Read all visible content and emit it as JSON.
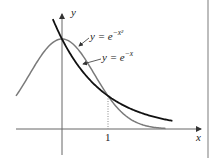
{
  "chart_data": {
    "type": "line",
    "title": "",
    "xlabel": "x",
    "ylabel": "y",
    "x_ticks": [
      "1"
    ],
    "xlim": [
      -1.0,
      2.4
    ],
    "ylim": [
      -0.35,
      1.4
    ],
    "grid": false,
    "annotations": [
      {
        "text": "dotted vertical line at x = 1 from axis to curve intersection",
        "x": 1,
        "y": 0.368
      }
    ],
    "series": [
      {
        "name": "y = e^{-x^2}",
        "label": "y = e",
        "label_exp": "−x²",
        "color": "#7a7a7a",
        "x": [
          -1.0,
          -0.75,
          -0.5,
          -0.25,
          0,
          0.25,
          0.5,
          0.75,
          1.0,
          1.25,
          1.5,
          1.75,
          2.0,
          2.25
        ],
        "y": [
          0.368,
          0.57,
          0.779,
          0.939,
          1.0,
          0.939,
          0.779,
          0.57,
          0.368,
          0.21,
          0.105,
          0.047,
          0.018,
          0.006
        ]
      },
      {
        "name": "y = e^{-x}",
        "label": "y = e",
        "label_exp": "−x",
        "color": "#111111",
        "x": [
          -0.2,
          0,
          0.25,
          0.5,
          0.75,
          1.0,
          1.25,
          1.5,
          1.75,
          2.0,
          2.25,
          2.4
        ],
        "y": [
          1.221,
          1.0,
          0.779,
          0.607,
          0.472,
          0.368,
          0.287,
          0.223,
          0.174,
          0.135,
          0.105,
          0.091
        ]
      }
    ],
    "legend_position": "inline labels with arrows"
  },
  "axes": {
    "x_label": "x",
    "y_label": "y",
    "tick_one": "1"
  },
  "labels": {
    "gauss_base": "y = e",
    "gauss_exp": "−x²",
    "exp_base": "y = e",
    "exp_exp": "−x"
  }
}
